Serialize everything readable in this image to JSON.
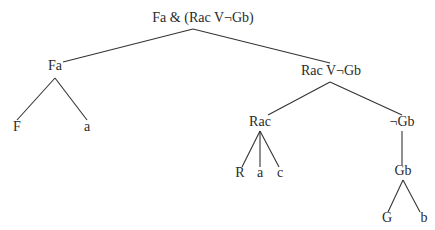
{
  "diagram": {
    "type": "parse-tree",
    "colors": {
      "background": "#ffffff",
      "text": "#2a2a2a",
      "lines": "#333333"
    },
    "nodes": {
      "root": {
        "label": "Fa & (Rac V¬Gb)",
        "x": 203,
        "y": 22,
        "anchor": [
          193,
          29
        ]
      },
      "fa": {
        "label": "Fa",
        "x": 55,
        "y": 70,
        "top": [
          63,
          62
        ],
        "anchor": [
          55,
          78
        ]
      },
      "f": {
        "label": "F",
        "x": 17,
        "y": 131,
        "top": [
          17,
          120
        ]
      },
      "a1": {
        "label": "a",
        "x": 87,
        "y": 131,
        "top": [
          87,
          120
        ]
      },
      "disj": {
        "label": "Rac V¬Gb",
        "x": 331,
        "y": 75,
        "top": [
          330,
          63
        ],
        "anchor": [
          330,
          82
        ]
      },
      "rac": {
        "label": "Rac",
        "x": 260,
        "y": 126,
        "top": [
          268,
          115
        ],
        "anchor": [
          260,
          131
        ]
      },
      "r": {
        "label": "R",
        "x": 240,
        "y": 177,
        "top": [
          242,
          167
        ]
      },
      "a2": {
        "label": "a",
        "x": 260,
        "y": 177,
        "top": [
          260,
          167
        ]
      },
      "c": {
        "label": "c",
        "x": 280,
        "y": 177,
        "top": [
          279,
          167
        ]
      },
      "neggb": {
        "label": "¬Gb",
        "x": 402,
        "y": 126,
        "top": [
          402,
          115
        ],
        "anchor": [
          402,
          131
        ]
      },
      "gb": {
        "label": "Gb",
        "x": 403,
        "y": 175,
        "top": [
          402,
          165
        ],
        "anchor": [
          403,
          180
        ]
      },
      "g": {
        "label": "G",
        "x": 387,
        "y": 222,
        "top": [
          388,
          212
        ]
      },
      "b": {
        "label": "b",
        "x": 424,
        "y": 222,
        "top": [
          420,
          212
        ]
      }
    },
    "edges": [
      {
        "from": "root",
        "to": "fa"
      },
      {
        "from": "root",
        "to": "disj"
      },
      {
        "from": "fa",
        "to": "f"
      },
      {
        "from": "fa",
        "to": "a1"
      },
      {
        "from": "disj",
        "to": "rac"
      },
      {
        "from": "disj",
        "to": "neggb"
      },
      {
        "from": "rac",
        "to": "r"
      },
      {
        "from": "rac",
        "to": "a2"
      },
      {
        "from": "rac",
        "to": "c"
      },
      {
        "from": "neggb",
        "to": "gb"
      },
      {
        "from": "gb",
        "to": "g"
      },
      {
        "from": "gb",
        "to": "b"
      }
    ]
  }
}
